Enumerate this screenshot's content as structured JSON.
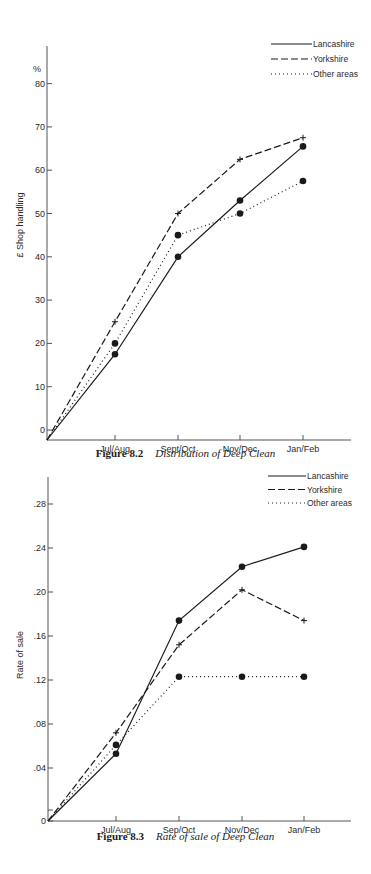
{
  "chart_data": [
    {
      "type": "line",
      "title": "Distribution of Deep Clean",
      "figure_number": "Figure 8.2",
      "xlabel": "",
      "ylabel": "£ Shop handling",
      "y_unit": "%",
      "categories": [
        "Jul/Aug",
        "Sept/Oct",
        "Nov/Dec",
        "Jan/Feb"
      ],
      "yticks": [
        "0",
        "10",
        "20",
        "30",
        "40",
        "50",
        "60",
        "70",
        "80"
      ],
      "ylim": [
        0,
        85
      ],
      "grid": false,
      "legend_position": "top-right",
      "series": [
        {
          "name": "Lancashire",
          "style": "solid",
          "marker": "dot",
          "values": [
            17.5,
            40,
            53,
            65.5
          ]
        },
        {
          "name": "Yorkshire",
          "style": "dashed",
          "marker": "cross",
          "values": [
            25,
            50,
            62.5,
            67.5
          ]
        },
        {
          "name": "Other areas",
          "style": "dotted",
          "marker": "dot",
          "values": [
            20,
            45,
            50,
            57.5
          ]
        }
      ]
    },
    {
      "type": "line",
      "title": "Rate of sale of Deep Clean",
      "figure_number": "Figure 8.3",
      "xlabel": "",
      "ylabel": "Rate of sale",
      "categories": [
        "Jul/Aug",
        "Sep/Oct",
        "Nov/Dec",
        "Jan/Feb"
      ],
      "yticks": [
        "0",
        ".04",
        ".08",
        ".12",
        ".16",
        ".20",
        ".24",
        ".28"
      ],
      "ylim": [
        0,
        0.3
      ],
      "grid": false,
      "legend_position": "top-right",
      "series": [
        {
          "name": "Lancashire",
          "style": "solid",
          "marker": "dot",
          "values": [
            0.053,
            0.174,
            0.223,
            0.241
          ]
        },
        {
          "name": "Yorkshire",
          "style": "dashed",
          "marker": "cross",
          "values": [
            0.072,
            0.152,
            0.202,
            0.174
          ]
        },
        {
          "name": "Other areas",
          "style": "dotted",
          "marker": "dot",
          "values": [
            0.061,
            0.123,
            0.123,
            0.123
          ]
        }
      ]
    }
  ],
  "captions": [
    {
      "number": "Figure 8.2",
      "title": "Distribution of Deep Clean"
    },
    {
      "number": "Figure 8.3",
      "title": "Rate of sale of Deep Clean"
    }
  ],
  "colors": {
    "ink": "#1a1a1a",
    "axis": "#555555"
  }
}
